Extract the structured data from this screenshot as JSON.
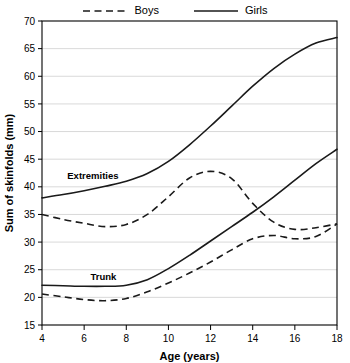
{
  "legend": {
    "entries": [
      {
        "label": "Boys",
        "style": "dashed",
        "icon": "dashed-line-icon"
      },
      {
        "label": "Girls",
        "style": "solid",
        "icon": "solid-line-icon"
      }
    ]
  },
  "annotations": {
    "extremities": "Extremities",
    "trunk": "Trunk"
  },
  "chart_data": {
    "type": "line",
    "title": "",
    "xlabel": "Age (years)",
    "ylabel": "Sum of skinfolds (mm)",
    "xlim": [
      4,
      18
    ],
    "ylim": [
      15,
      70
    ],
    "xticks": [
      4,
      6,
      8,
      10,
      12,
      14,
      16,
      18
    ],
    "yticks": [
      15,
      20,
      25,
      30,
      35,
      40,
      45,
      50,
      55,
      60,
      65,
      70
    ],
    "grid": "horizontal",
    "legend_position": "top-center",
    "x": [
      4,
      5,
      6,
      7,
      8,
      9,
      10,
      11,
      12,
      13,
      14,
      15,
      16,
      17,
      18
    ],
    "series": [
      {
        "name": "Girls Extremities",
        "sex": "Girls",
        "site": "Extremities",
        "style": "solid",
        "values": [
          38.0,
          38.6,
          39.3,
          40.1,
          41.0,
          42.4,
          44.6,
          47.6,
          51.0,
          54.6,
          58.2,
          61.4,
          64.0,
          66.0,
          67.0
        ]
      },
      {
        "name": "Boys Extremities",
        "sex": "Boys",
        "site": "Extremities",
        "style": "dashed",
        "values": [
          35.0,
          34.1,
          33.4,
          32.8,
          33.2,
          35.0,
          38.2,
          41.6,
          42.8,
          41.5,
          37.0,
          33.6,
          32.3,
          32.6,
          33.3
        ]
      },
      {
        "name": "Girls Trunk",
        "sex": "Girls",
        "site": "Trunk",
        "style": "solid",
        "values": [
          22.2,
          22.1,
          22.0,
          22.0,
          22.2,
          23.2,
          25.2,
          27.6,
          30.2,
          32.8,
          35.4,
          38.2,
          41.2,
          44.2,
          46.8
        ]
      },
      {
        "name": "Boys Trunk",
        "sex": "Boys",
        "site": "Trunk",
        "style": "dashed",
        "values": [
          20.6,
          20.1,
          19.6,
          19.4,
          19.8,
          21.0,
          22.6,
          24.4,
          26.4,
          28.6,
          30.6,
          31.2,
          30.6,
          31.0,
          33.3
        ]
      }
    ]
  }
}
